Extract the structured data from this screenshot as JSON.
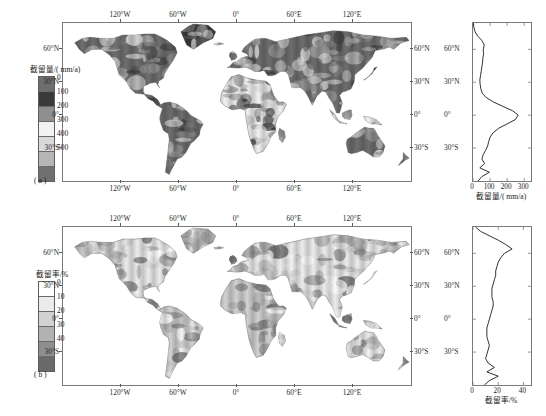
{
  "figure": {
    "background": "#ffffff",
    "axis_color": "#7a7a7a"
  },
  "chart_data": [
    {
      "type": "heatmap",
      "panel": "a",
      "panel_tag": "( a )",
      "title": "",
      "xlabel": "",
      "ylabel": "",
      "colorbar_title": "截留量/( mm/a)",
      "colorbar_ticks": [
        "0",
        "100",
        "200",
        "300",
        "400",
        "500"
      ],
      "colorbar_colors": [
        "#6e6e6e",
        "#3a3a3a",
        "#8f8f8f",
        "#f2f2f2",
        "#d9d9d9",
        "#b5b5b5",
        "#707070"
      ],
      "lon_ticks": [
        "120°W",
        "60°W",
        "0°",
        "60°E",
        "120°E"
      ],
      "lon_values": [
        -120,
        -60,
        0,
        60,
        120
      ],
      "lat_ticks": [
        "60°N",
        "30°N",
        "0°",
        "30°S"
      ],
      "lat_values": [
        60,
        30,
        0,
        -30
      ],
      "xlim": [
        -180,
        180
      ],
      "ylim": [
        -60,
        84
      ],
      "grid": false
    },
    {
      "type": "line",
      "panel": "a-profile",
      "title": "",
      "xlabel": "截留量/( mm/a)",
      "ylabel": "",
      "x_ticks": [
        "0",
        "100",
        "200",
        "300"
      ],
      "x_values": [
        0,
        100,
        200,
        300
      ],
      "y_ticks": [
        "60°N",
        "30°N",
        "0°",
        "30°S"
      ],
      "y_values": [
        60,
        30,
        0,
        -30
      ],
      "xlim": [
        0,
        340
      ],
      "ylim": [
        -60,
        84
      ],
      "grid": false,
      "series": [
        {
          "name": "zonal-mean-interception-depth",
          "lat": [
            84,
            80,
            76,
            72,
            68,
            64,
            60,
            56,
            52,
            48,
            44,
            40,
            36,
            32,
            28,
            24,
            20,
            16,
            12,
            8,
            4,
            0,
            -4,
            -8,
            -12,
            -16,
            -20,
            -24,
            -28,
            -32,
            -36,
            -40,
            -44,
            -48,
            -52,
            -56,
            -60
          ],
          "values": [
            2,
            5,
            12,
            28,
            52,
            66,
            60,
            62,
            58,
            56,
            52,
            48,
            44,
            40,
            42,
            46,
            54,
            78,
            120,
            175,
            232,
            265,
            248,
            200,
            150,
            118,
            100,
            92,
            86,
            74,
            60,
            52,
            68,
            40,
            96,
            52,
            30
          ]
        }
      ]
    },
    {
      "type": "heatmap",
      "panel": "b",
      "panel_tag": "( b )",
      "title": "",
      "xlabel": "",
      "ylabel": "",
      "colorbar_title": "截留率/%",
      "colorbar_ticks": [
        "0",
        "10",
        "20",
        "30",
        "40"
      ],
      "colorbar_colors": [
        "#ffffff",
        "#ececec",
        "#d2d2d2",
        "#b2b2b2",
        "#8e8e8e",
        "#6a6a6a"
      ],
      "lon_ticks": [
        "120°W",
        "60°W",
        "0°",
        "60°E",
        "120°E"
      ],
      "lon_values": [
        -120,
        -60,
        0,
        60,
        120
      ],
      "lat_ticks": [
        "60°N",
        "30°N",
        "0°",
        "30°S"
      ],
      "lat_values": [
        60,
        30,
        0,
        -30
      ],
      "xlim": [
        -180,
        180
      ],
      "ylim": [
        -60,
        84
      ],
      "grid": false
    },
    {
      "type": "line",
      "panel": "b-profile",
      "title": "",
      "xlabel": "截留率/%",
      "ylabel": "",
      "x_ticks": [
        "0",
        "20",
        "40"
      ],
      "x_values": [
        0,
        20,
        40
      ],
      "y_ticks": [
        "60°N",
        "30°N",
        "0°",
        "30°S"
      ],
      "y_values": [
        60,
        30,
        0,
        -30
      ],
      "xlim": [
        0,
        46
      ],
      "ylim": [
        -60,
        84
      ],
      "grid": false,
      "series": [
        {
          "name": "zonal-mean-interception-rate",
          "lat": [
            84,
            80,
            76,
            72,
            68,
            64,
            60,
            56,
            52,
            48,
            44,
            40,
            36,
            32,
            28,
            24,
            20,
            16,
            12,
            8,
            4,
            0,
            -4,
            -8,
            -12,
            -16,
            -20,
            -24,
            -28,
            -32,
            -36,
            -40,
            -44,
            -48,
            -52,
            -56,
            -60
          ],
          "values": [
            2,
            6,
            13,
            20,
            26,
            31,
            25,
            22,
            20,
            19,
            18,
            18,
            17,
            16,
            15,
            15,
            15,
            16,
            16,
            15,
            14,
            13,
            12,
            11,
            11,
            11,
            12,
            13,
            12,
            11,
            10,
            12,
            17,
            11,
            20,
            13,
            9
          ]
        }
      ]
    }
  ]
}
